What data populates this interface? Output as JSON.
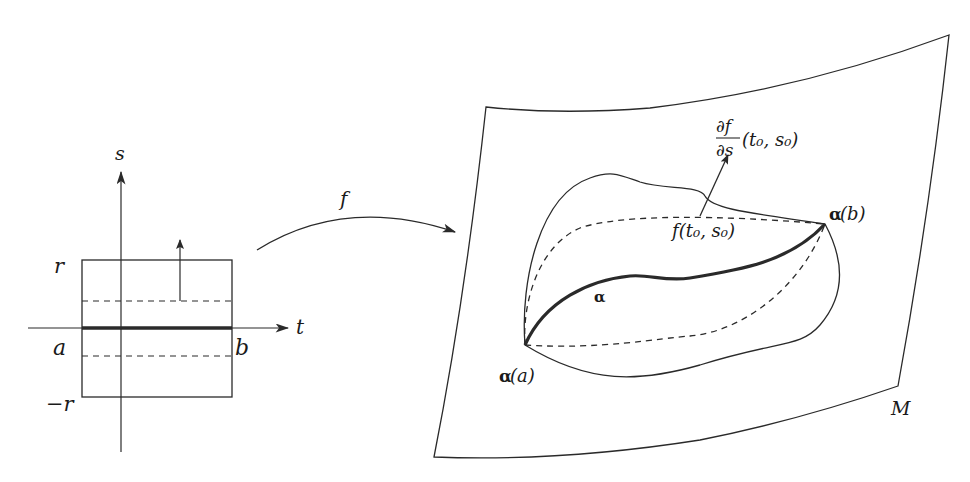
{
  "domain": "diagram",
  "colors": {
    "stroke": "#2a2a2a",
    "background": "#ffffff"
  },
  "parameter_domain": {
    "axis_s_label": "s",
    "axis_t_label": "t",
    "r_label": "r",
    "neg_r_label": "−r",
    "a_label": "a",
    "b_label": "b"
  },
  "map": {
    "label": "f"
  },
  "surface": {
    "label": "M",
    "curve_label": "α",
    "start_label_greek": "α",
    "start_label_arg": "(a)",
    "end_label_greek": "α",
    "end_label_arg": "(b)",
    "point_label": "f(t₀, s₀)",
    "derivative_numerator": "∂f",
    "derivative_denominator": "∂s",
    "derivative_args": "(t₀, s₀)"
  }
}
